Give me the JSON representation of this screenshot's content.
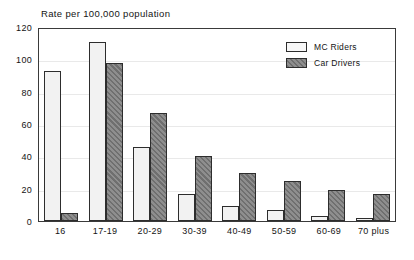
{
  "chart_data": {
    "type": "bar",
    "title": "Rate per 100,000 population",
    "xlabel": "",
    "ylabel": "",
    "ylim": [
      0,
      120
    ],
    "yticks": [
      0,
      20,
      40,
      60,
      80,
      100,
      120
    ],
    "grid": true,
    "legend_position": "top-right",
    "categories": [
      "16",
      "17-19",
      "20-29",
      "30-39",
      "40-49",
      "50-59",
      "60-69",
      "70 plus"
    ],
    "series": [
      {
        "name": "MC Riders",
        "color": "#f2f2f2",
        "values": [
          93,
          111,
          46,
          17,
          9,
          7,
          3,
          2
        ]
      },
      {
        "name": "Car Drivers",
        "color": "#6f6f6f",
        "values": [
          5,
          98,
          67,
          40,
          30,
          25,
          19,
          17
        ]
      }
    ]
  }
}
